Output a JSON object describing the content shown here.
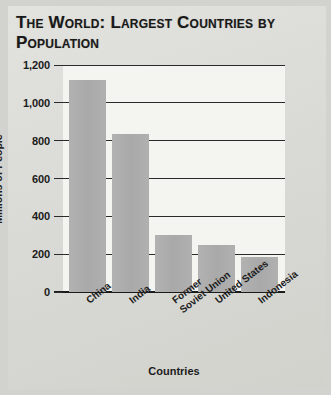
{
  "title": "The World: Largest Countries by Population",
  "colors": {
    "bar": "#adadad",
    "plot_background": "#f4f4f1",
    "page_background": "#d8d8d4",
    "axis": "#1b1b1b",
    "text": "#191919"
  },
  "axis": {
    "ylabel": "Millions of People",
    "xlabel": "Countries",
    "yticks": [
      "0",
      "200",
      "400",
      "600",
      "800",
      "1,000",
      "1,200"
    ]
  },
  "chart_data": {
    "type": "bar",
    "title": "The World: Largest Countries by Population",
    "xlabel": "Countries",
    "ylabel": "Millions of People",
    "categories": [
      "China",
      "India",
      "Former Soviet Union",
      "United States",
      "Indonesia"
    ],
    "category_lines": [
      [
        "China"
      ],
      [
        "India"
      ],
      [
        "Former",
        "Soviet Union"
      ],
      [
        "United States"
      ],
      [
        "Indonesia"
      ]
    ],
    "values": [
      1120,
      835,
      300,
      250,
      185
    ],
    "ylim": [
      0,
      1200
    ],
    "ytick_values": [
      0,
      200,
      400,
      600,
      800,
      1000,
      1200
    ],
    "grid": true,
    "legend": false
  }
}
